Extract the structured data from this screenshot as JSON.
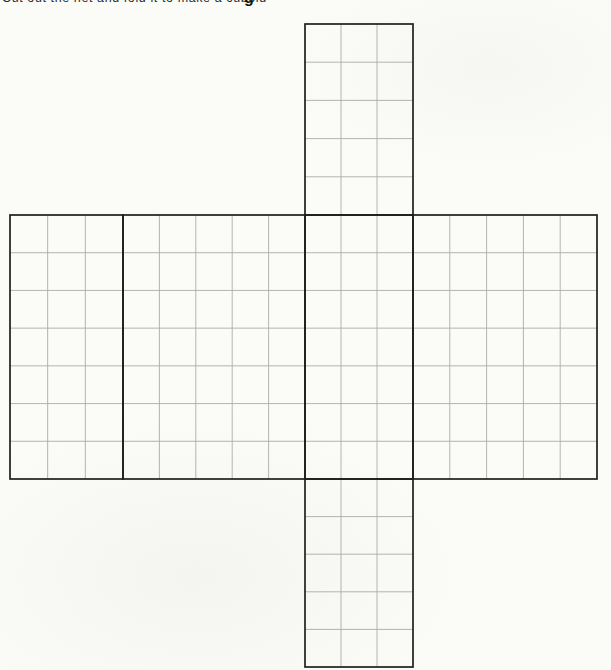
{
  "header": {
    "instruction_text": "Cut out the net and fold it to make a cuboid",
    "instruction_descender": "g"
  },
  "net": {
    "kind": "cuboid-net",
    "cuboid_dimensions_units": [
      3,
      5,
      7
    ],
    "colors": {
      "paper": "#fbfbf8",
      "outline": "#1e1e1e",
      "grid_line": "#ababab"
    },
    "stroke_widths": {
      "outline_px": 1.7,
      "grid_px": 0.9
    },
    "canvas": {
      "width": 611,
      "height": 670
    },
    "faces": [
      {
        "name": "top-face-3x5",
        "x": 305,
        "y": 24,
        "w": 108,
        "h": 191,
        "cols": 3,
        "rows": 5
      },
      {
        "name": "side-face-3x7-left",
        "x": 10,
        "y": 215,
        "w": 113,
        "h": 264,
        "cols": 3,
        "rows": 7
      },
      {
        "name": "side-face-5x7-front",
        "x": 123,
        "y": 215,
        "w": 182,
        "h": 264,
        "cols": 5,
        "rows": 7
      },
      {
        "name": "side-face-3x7-middle",
        "x": 305,
        "y": 215,
        "w": 108,
        "h": 264,
        "cols": 3,
        "rows": 7
      },
      {
        "name": "side-face-5x7-right",
        "x": 413,
        "y": 215,
        "w": 184,
        "h": 264,
        "cols": 5,
        "rows": 7
      },
      {
        "name": "bottom-face-3x5",
        "x": 305,
        "y": 479,
        "w": 108,
        "h": 188,
        "cols": 3,
        "rows": 5
      }
    ]
  }
}
